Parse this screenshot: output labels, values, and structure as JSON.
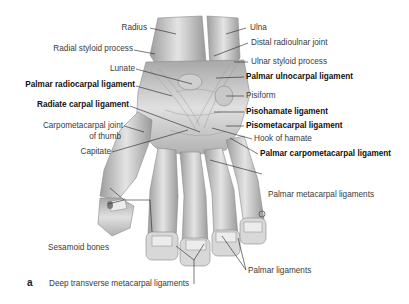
{
  "figure": {
    "panel_letter": "a",
    "labels_left": [
      {
        "text": "Radius",
        "bold": false
      },
      {
        "text": "Radial styloid process",
        "bold": false
      },
      {
        "text": "Lunate",
        "bold": false
      },
      {
        "text": "Palmar radiocarpal ligament",
        "bold": true
      },
      {
        "text": "Radiate carpal ligament",
        "bold": true
      },
      {
        "text": "Carpometacarpal joint",
        "bold": false
      },
      {
        "text": "of thumb",
        "bold": false
      },
      {
        "text": "Capitate",
        "bold": false
      },
      {
        "text": "Sesamoid bones",
        "bold": false
      }
    ],
    "labels_right": [
      {
        "text": "Ulna",
        "bold": false
      },
      {
        "text": "Distal radioulnar joint",
        "bold": false
      },
      {
        "text": "Ulnar styloid process",
        "bold": false
      },
      {
        "text": "Palmar ulnocarpal ligament",
        "bold": true
      },
      {
        "text": "Pisiform",
        "bold": false
      },
      {
        "text": "Pisohamate ligament",
        "bold": true
      },
      {
        "text": "Pisometacarpal ligament",
        "bold": true
      },
      {
        "text": "Hook of hamate",
        "bold": false
      },
      {
        "text": "Palmar carpometacarpal ligament",
        "bold": true
      },
      {
        "text": "Palmar metacarpal ligaments",
        "bold": false
      },
      {
        "text": "Palmar ligaments",
        "bold": false
      }
    ],
    "labels_bottom": [
      {
        "text": "Deep transverse metacarpal ligaments",
        "bold": false
      }
    ],
    "colors": {
      "bone_fill": "#d9d9d9",
      "bone_shade": "#a9a9a9",
      "ligament": "#c4c4c4",
      "leader_line": "#222222",
      "text": "#3a3a3a",
      "text_bold": "#111111"
    }
  }
}
